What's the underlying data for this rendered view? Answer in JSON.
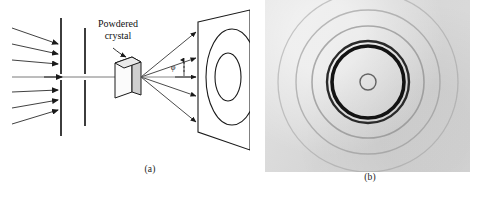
{
  "figure": {
    "kind": "two-panel scientific figure",
    "background_color": "#ffffff",
    "ink_color": "#1a1a1a"
  },
  "panel_a": {
    "caption": "(a)",
    "type": "line-art schematic",
    "labels": {
      "crystal_line1": "Powdered",
      "crystal_line2": "crystal",
      "angle_symbol": "φ"
    },
    "elements": {
      "incident_beam_arrows": 6,
      "collimator_slits": 2,
      "sample": "powdered crystal cube",
      "diffracted_rays": 4,
      "screen_rings": 2,
      "screen_shape": "parallelogram in perspective"
    }
  },
  "panel_b": {
    "caption": "(b)",
    "type": "grayscale diffraction photograph",
    "base_color": "#d9d9d9",
    "center": {
      "x": 103,
      "y": 82
    },
    "rings": [
      {
        "radius": 8,
        "darkness": 0.55,
        "width": 1.4,
        "name": "beam-stop-shadow"
      },
      {
        "radius": 36,
        "darkness": 0.9,
        "width": 3.6,
        "name": "principal-ring-inner"
      },
      {
        "radius": 41,
        "darkness": 0.78,
        "width": 2.4,
        "name": "principal-ring-outer"
      },
      {
        "radius": 56,
        "darkness": 0.3,
        "width": 1.6,
        "name": "faint-ring-1"
      },
      {
        "radius": 72,
        "darkness": 0.24,
        "width": 1.4,
        "name": "faint-ring-2"
      },
      {
        "radius": 90,
        "darkness": 0.18,
        "width": 1.3,
        "name": "faint-ring-3"
      }
    ]
  }
}
